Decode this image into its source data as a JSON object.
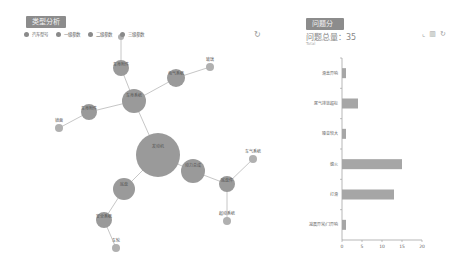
{
  "left_panel": {
    "title": "类型分析",
    "legend": [
      {
        "label": "汽车型号",
        "color": "#8a8a8a"
      },
      {
        "label": "一级参数",
        "color": "#8a8a8a"
      },
      {
        "label": "二级参数",
        "color": "#8a8a8a"
      },
      {
        "label": "三级参数",
        "color": "#8a8a8a"
      }
    ],
    "refresh_icon": "↻",
    "graph": {
      "nodes": [
        {
          "id": "center",
          "label": "发动机",
          "x": 158,
          "y": 155,
          "r": 22
        },
        {
          "id": "n1",
          "label": "车身系统",
          "x": 134,
          "y": 101,
          "r": 12
        },
        {
          "id": "n2",
          "label": "车身附件",
          "x": 121,
          "y": 68,
          "r": 8
        },
        {
          "id": "n3",
          "label": "",
          "x": 121,
          "y": 37,
          "r": 3
        },
        {
          "id": "n4",
          "label": "电气系统",
          "x": 176,
          "y": 78,
          "r": 9
        },
        {
          "id": "n5",
          "label": "玻璃",
          "x": 210,
          "y": 67,
          "r": 4
        },
        {
          "id": "n6",
          "label": "车身附件",
          "x": 89,
          "y": 112,
          "r": 8
        },
        {
          "id": "n7",
          "label": "镜面",
          "x": 59,
          "y": 128,
          "r": 4
        },
        {
          "id": "n8",
          "label": "动力总成",
          "x": 193,
          "y": 171,
          "r": 12
        },
        {
          "id": "n9",
          "label": "底盘件",
          "x": 227,
          "y": 184,
          "r": 8
        },
        {
          "id": "n10",
          "label": "车气系统",
          "x": 253,
          "y": 159,
          "r": 4
        },
        {
          "id": "n11",
          "label": "起动系统",
          "x": 227,
          "y": 221,
          "r": 4
        },
        {
          "id": "n12",
          "label": "底盘",
          "x": 124,
          "y": 189,
          "r": 11
        },
        {
          "id": "n13",
          "label": "安全系统",
          "x": 104,
          "y": 220,
          "r": 8
        },
        {
          "id": "n14",
          "label": "车轮",
          "x": 116,
          "y": 248,
          "r": 4
        }
      ],
      "edges": [
        [
          "center",
          "n1"
        ],
        [
          "n1",
          "n2"
        ],
        [
          "n2",
          "n3"
        ],
        [
          "n1",
          "n4"
        ],
        [
          "n4",
          "n5"
        ],
        [
          "n1",
          "n6"
        ],
        [
          "n6",
          "n7"
        ],
        [
          "center",
          "n8"
        ],
        [
          "n8",
          "n9"
        ],
        [
          "n9",
          "n10"
        ],
        [
          "n9",
          "n11"
        ],
        [
          "center",
          "n12"
        ],
        [
          "n12",
          "n13"
        ],
        [
          "n13",
          "n14"
        ]
      ]
    }
  },
  "right_panel": {
    "title": "问题分析",
    "stat_label": "问题总量：35",
    "stat_sub": "Total",
    "toolbar": {
      "line_icon": "⌞",
      "bar_icon": "▥",
      "refresh_icon": "↻"
    },
    "left_refresh_icon": "↻"
  },
  "chart_data": {
    "type": "bar",
    "orientation": "horizontal",
    "title": "问题总量：35",
    "categories": [
      "滑盖异响",
      "尾气排放超标",
      "噪音较大",
      "熄火",
      "打滑",
      "减震异常/门异响"
    ],
    "values": [
      1,
      4,
      1,
      15,
      13,
      1
    ],
    "xlabel": "",
    "ylabel": "",
    "xlim": [
      0,
      20
    ],
    "xticks": [
      0,
      5,
      10,
      15,
      20
    ],
    "grid": false,
    "bar_color": "#a6a6a6"
  }
}
